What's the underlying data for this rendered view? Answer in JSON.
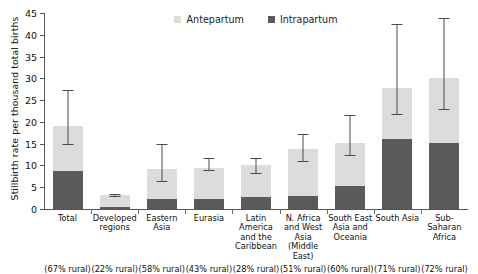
{
  "chart_data": {
    "type": "bar",
    "subtype": "stacked-bar-with-error-bars",
    "title": "",
    "xlabel": "",
    "ylabel": "Stillbirth rate per thousand total births",
    "ylim": [
      0,
      45
    ],
    "yticks": [
      0,
      5,
      10,
      15,
      20,
      25,
      30,
      35,
      40,
      45
    ],
    "grid": false,
    "legend_position": "top-center",
    "categories": [
      "Total",
      "Developed regions",
      "Eastern Asia",
      "Eurasia",
      "Latin America and the Caribbean",
      "N. Africa and West Asia (Middle East)",
      "South East Asia and Oceania",
      "South Asia",
      "Sub-Saharan Africa"
    ],
    "category_lines": [
      [
        "Total"
      ],
      [
        "Developed",
        "regions"
      ],
      [
        "Eastern Asia"
      ],
      [
        "Eurasia"
      ],
      [
        "Latin America",
        "and the",
        "Caribbean"
      ],
      [
        "N. Africa",
        "and West Asia",
        "(Middle East)"
      ],
      [
        "South East",
        "Asia and",
        "Oceania"
      ],
      [
        "South Asia"
      ],
      [
        "Sub-Saharan",
        "Africa"
      ]
    ],
    "category_sublabels": [
      "(67% rural)",
      "(22% rural)",
      "(58% rural)",
      "(43% rural)",
      "(28% rural)",
      "(51% rural)",
      "(60% rural)",
      "(71% rural)",
      "(72% rural)"
    ],
    "series": [
      {
        "name": "Intrapartum",
        "color": "#5a5a5a",
        "values": [
          8.7,
          0.5,
          2.3,
          2.4,
          2.8,
          3.0,
          5.2,
          16.1,
          15.1
        ]
      },
      {
        "name": "Antepartum",
        "color": "#dcdcdc",
        "values": [
          10.4,
          2.7,
          6.9,
          7.0,
          7.3,
          10.8,
          10.0,
          11.7,
          15.0
        ]
      }
    ],
    "totals": [
      19.1,
      3.2,
      9.2,
      9.4,
      10.1,
      13.8,
      15.2,
      27.8,
      30.1
    ],
    "error_bars": {
      "low": [
        14.9,
        2.9,
        6.5,
        9.0,
        8.3,
        11.1,
        12.4,
        21.8,
        22.9
      ],
      "high": [
        27.3,
        3.5,
        15.0,
        11.7,
        11.6,
        17.3,
        21.6,
        42.4,
        43.9
      ]
    }
  },
  "legend": {
    "items": [
      {
        "label": "Antepartum",
        "color": "#dcdcdc"
      },
      {
        "label": "Intrapartum",
        "color": "#5a5a5a"
      }
    ]
  },
  "colors": {
    "antepartum": "#dcdcdc",
    "intrapartum": "#5a5a5a",
    "axis": "#555555",
    "error_bar": "#4a4a4a",
    "background": "#ffffff",
    "text": "#111111"
  }
}
